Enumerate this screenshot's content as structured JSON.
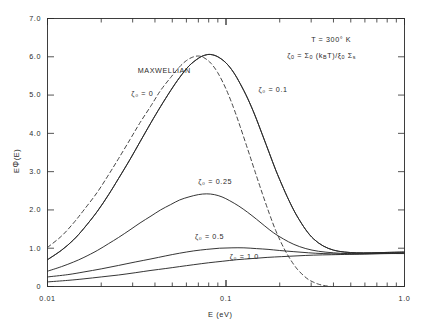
{
  "chart_data": {
    "type": "line",
    "title": "",
    "xlabel": "E (eV)",
    "ylabel": "EΦ(E)",
    "xscale": "log",
    "xlim": [
      0.01,
      1.0
    ],
    "ylim": [
      0,
      7.0
    ],
    "grid": false,
    "legend_position": "inline-annotations",
    "x_tick_labels": [
      "0.01",
      "0.1",
      "1.0"
    ],
    "x_tick_values": [
      0.01,
      0.1,
      1.0
    ],
    "y_tick_labels": [
      "0",
      "1.0",
      "2.0",
      "3.0",
      "4.0",
      "5.0",
      "6.0",
      "7.0"
    ],
    "y_tick_values": [
      0,
      1.0,
      2.0,
      3.0,
      4.0,
      5.0,
      6.0,
      7.0
    ],
    "annotations": [
      {
        "text": "MAXWELLIAN",
        "x": 0.032,
        "y": 5.62
      },
      {
        "text": "T = 300° K",
        "x": 0.3,
        "y": 6.45
      },
      {
        "text": "ζ₀ = Σ₀ (kʙT)/ξ₀ Σₛ",
        "x": 0.3,
        "y": 6.02
      }
    ],
    "series": [
      {
        "name": "Maxwellian",
        "label": "ζ₀ = 0",
        "style": "dashed",
        "color": "#3a3a3a",
        "label_x": 0.031,
        "label_y": 5.02,
        "points": [
          [
            0.01,
            1.02
          ],
          [
            0.012,
            1.32
          ],
          [
            0.014,
            1.66
          ],
          [
            0.016,
            2.0
          ],
          [
            0.019,
            2.46
          ],
          [
            0.022,
            2.92
          ],
          [
            0.025,
            3.34
          ],
          [
            0.029,
            3.84
          ],
          [
            0.033,
            4.28
          ],
          [
            0.038,
            4.72
          ],
          [
            0.043,
            5.12
          ],
          [
            0.049,
            5.46
          ],
          [
            0.055,
            5.74
          ],
          [
            0.06,
            5.9
          ],
          [
            0.065,
            5.99
          ],
          [
            0.07,
            6.02
          ],
          [
            0.075,
            5.98
          ],
          [
            0.082,
            5.84
          ],
          [
            0.09,
            5.58
          ],
          [
            0.1,
            5.16
          ],
          [
            0.11,
            4.68
          ],
          [
            0.12,
            4.18
          ],
          [
            0.132,
            3.6
          ],
          [
            0.145,
            3.02
          ],
          [
            0.16,
            2.42
          ],
          [
            0.175,
            1.9
          ],
          [
            0.19,
            1.46
          ],
          [
            0.21,
            1.02
          ],
          [
            0.23,
            0.7
          ],
          [
            0.25,
            0.46
          ],
          [
            0.27,
            0.3
          ],
          [
            0.29,
            0.18
          ],
          [
            0.31,
            0.11
          ],
          [
            0.33,
            0.06
          ],
          [
            0.35,
            0.03
          ],
          [
            0.37,
            0.01
          ],
          [
            0.39,
            0.0
          ]
        ]
      },
      {
        "name": "zeta0-0",
        "label": "ζ₀ = 0",
        "style": "solid",
        "color": "#2a2a2a",
        "points": [
          [
            0.01,
            0.7
          ],
          [
            0.012,
            0.95
          ],
          [
            0.014,
            1.22
          ],
          [
            0.016,
            1.52
          ],
          [
            0.019,
            1.96
          ],
          [
            0.022,
            2.4
          ],
          [
            0.025,
            2.82
          ],
          [
            0.029,
            3.32
          ],
          [
            0.033,
            3.78
          ],
          [
            0.038,
            4.28
          ],
          [
            0.043,
            4.7
          ],
          [
            0.049,
            5.12
          ],
          [
            0.055,
            5.46
          ],
          [
            0.062,
            5.76
          ],
          [
            0.07,
            5.96
          ],
          [
            0.076,
            6.04
          ],
          [
            0.082,
            6.06
          ],
          [
            0.09,
            6.0
          ],
          [
            0.1,
            5.84
          ],
          [
            0.11,
            5.6
          ],
          [
            0.12,
            5.3
          ],
          [
            0.132,
            4.92
          ],
          [
            0.145,
            4.48
          ],
          [
            0.16,
            3.96
          ],
          [
            0.175,
            3.48
          ],
          [
            0.19,
            3.04
          ],
          [
            0.21,
            2.56
          ],
          [
            0.23,
            2.16
          ],
          [
            0.25,
            1.84
          ],
          [
            0.28,
            1.48
          ],
          [
            0.31,
            1.24
          ],
          [
            0.35,
            1.06
          ],
          [
            0.4,
            0.95
          ],
          [
            0.46,
            0.9
          ],
          [
            0.54,
            0.88
          ],
          [
            0.65,
            0.88
          ],
          [
            0.8,
            0.89
          ],
          [
            1.0,
            0.9
          ]
        ]
      },
      {
        "name": "zeta0-0.1",
        "label": "ζ₀ = 0.1",
        "style": "solid",
        "color": "#2a2a2a",
        "label_x": 0.155,
        "label_y": 5.12,
        "points": [
          [
            0.01,
            0.7
          ],
          [
            0.012,
            0.95
          ],
          [
            0.014,
            1.22
          ],
          [
            0.016,
            1.52
          ],
          [
            0.019,
            1.96
          ],
          [
            0.022,
            2.4
          ],
          [
            0.025,
            2.82
          ],
          [
            0.029,
            3.32
          ],
          [
            0.033,
            3.78
          ],
          [
            0.038,
            4.28
          ],
          [
            0.043,
            4.7
          ],
          [
            0.049,
            5.12
          ],
          [
            0.055,
            5.46
          ],
          [
            0.062,
            5.76
          ],
          [
            0.07,
            5.96
          ],
          [
            0.076,
            6.04
          ],
          [
            0.082,
            6.06
          ],
          [
            0.09,
            6.0
          ],
          [
            0.1,
            5.84
          ],
          [
            0.11,
            5.6
          ],
          [
            0.12,
            5.3
          ],
          [
            0.132,
            4.92
          ],
          [
            0.145,
            4.48
          ],
          [
            0.16,
            3.96
          ],
          [
            0.175,
            3.48
          ],
          [
            0.19,
            3.04
          ],
          [
            0.21,
            2.56
          ],
          [
            0.23,
            2.16
          ],
          [
            0.25,
            1.84
          ],
          [
            0.28,
            1.48
          ],
          [
            0.31,
            1.24
          ],
          [
            0.35,
            1.06
          ],
          [
            0.4,
            0.95
          ],
          [
            0.46,
            0.9
          ],
          [
            0.54,
            0.88
          ],
          [
            0.65,
            0.88
          ],
          [
            0.8,
            0.89
          ],
          [
            1.0,
            0.9
          ]
        ]
      },
      {
        "name": "zeta0-0.25",
        "label": "ζ₀ = 0.25",
        "style": "solid",
        "color": "#2a2a2a",
        "label_x": 0.072,
        "label_y": 2.72,
        "points": [
          [
            0.01,
            0.4
          ],
          [
            0.012,
            0.52
          ],
          [
            0.014,
            0.64
          ],
          [
            0.016,
            0.76
          ],
          [
            0.019,
            0.94
          ],
          [
            0.022,
            1.12
          ],
          [
            0.025,
            1.28
          ],
          [
            0.029,
            1.48
          ],
          [
            0.033,
            1.66
          ],
          [
            0.038,
            1.84
          ],
          [
            0.043,
            2.0
          ],
          [
            0.049,
            2.14
          ],
          [
            0.055,
            2.26
          ],
          [
            0.062,
            2.34
          ],
          [
            0.07,
            2.4
          ],
          [
            0.078,
            2.42
          ],
          [
            0.086,
            2.4
          ],
          [
            0.095,
            2.34
          ],
          [
            0.105,
            2.24
          ],
          [
            0.118,
            2.1
          ],
          [
            0.132,
            1.94
          ],
          [
            0.148,
            1.76
          ],
          [
            0.165,
            1.58
          ],
          [
            0.185,
            1.4
          ],
          [
            0.21,
            1.24
          ],
          [
            0.24,
            1.1
          ],
          [
            0.28,
            0.99
          ],
          [
            0.33,
            0.92
          ],
          [
            0.4,
            0.88
          ],
          [
            0.48,
            0.86
          ],
          [
            0.6,
            0.86
          ],
          [
            0.78,
            0.87
          ],
          [
            1.0,
            0.88
          ]
        ]
      },
      {
        "name": "zeta0-0.5",
        "label": "ζ₀ = 0.5",
        "style": "solid",
        "color": "#2a2a2a",
        "label_x": 0.07,
        "label_y": 1.26,
        "points": [
          [
            0.01,
            0.25
          ],
          [
            0.013,
            0.31
          ],
          [
            0.016,
            0.38
          ],
          [
            0.02,
            0.46
          ],
          [
            0.025,
            0.55
          ],
          [
            0.031,
            0.64
          ],
          [
            0.038,
            0.72
          ],
          [
            0.046,
            0.8
          ],
          [
            0.055,
            0.87
          ],
          [
            0.066,
            0.93
          ],
          [
            0.078,
            0.97
          ],
          [
            0.092,
            1.0
          ],
          [
            0.108,
            1.01
          ],
          [
            0.126,
            1.01
          ],
          [
            0.148,
            0.99
          ],
          [
            0.172,
            0.97
          ],
          [
            0.2,
            0.94
          ],
          [
            0.24,
            0.91
          ],
          [
            0.29,
            0.88
          ],
          [
            0.35,
            0.86
          ],
          [
            0.43,
            0.85
          ],
          [
            0.54,
            0.85
          ],
          [
            0.7,
            0.86
          ],
          [
            1.0,
            0.87
          ]
        ]
      },
      {
        "name": "zeta0-1.0",
        "label": "ζ₀ = 1.0",
        "style": "solid",
        "color": "#2a2a2a",
        "label_x": 0.11,
        "label_y": 0.75,
        "points": [
          [
            0.01,
            0.12
          ],
          [
            0.013,
            0.16
          ],
          [
            0.016,
            0.2
          ],
          [
            0.02,
            0.25
          ],
          [
            0.025,
            0.3
          ],
          [
            0.031,
            0.36
          ],
          [
            0.038,
            0.42
          ],
          [
            0.046,
            0.47
          ],
          [
            0.055,
            0.52
          ],
          [
            0.066,
            0.57
          ],
          [
            0.08,
            0.62
          ],
          [
            0.096,
            0.66
          ],
          [
            0.115,
            0.7
          ],
          [
            0.14,
            0.73
          ],
          [
            0.17,
            0.76
          ],
          [
            0.205,
            0.78
          ],
          [
            0.25,
            0.8
          ],
          [
            0.31,
            0.82
          ],
          [
            0.39,
            0.83
          ],
          [
            0.49,
            0.84
          ],
          [
            0.64,
            0.85
          ],
          [
            0.82,
            0.86
          ],
          [
            1.0,
            0.86
          ]
        ]
      }
    ]
  },
  "axis": {
    "x_title": "E (eV)",
    "y_title_plain": "EΦ(E)"
  },
  "annotation_text": {
    "maxwellian": "MAXWELLIAN",
    "temperature": "T = 300° K",
    "formula_prefix": "ζ",
    "formula_line": "ζ₀ = Σ₀ (kʙT)/ξ₀ Σₛ"
  },
  "labels": {
    "zeta_0": "ζ₀ = 0",
    "zeta_01": "ζ₀ = 0.1",
    "zeta_025": "ζ₀ = 0.25",
    "zeta_05": "ζ₀ = 0.5",
    "zeta_10": "ζ₀ = 1.0"
  },
  "colors": {
    "axis": "#2a2a2a",
    "curve": "#2a2a2a",
    "dashed": "#3a3a3a",
    "background": "#ffffff"
  }
}
